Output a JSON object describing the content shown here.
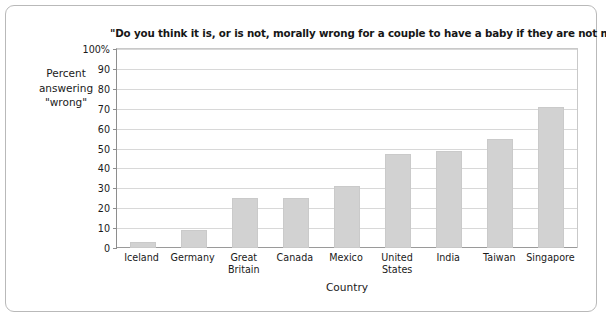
{
  "chart_data": {
    "type": "bar",
    "title": "\"Do you think it is, or is not, morally wrong for a couple to have a baby if they are not married?\"",
    "xlabel": "Country",
    "ylabel": "Percent answering \"wrong\"",
    "categories": [
      "Iceland",
      "Germany",
      "Great Britain",
      "Canada",
      "Mexico",
      "United States",
      "India",
      "Taiwan",
      "Singapore"
    ],
    "values": [
      3,
      9,
      25,
      25,
      31,
      47,
      49,
      55,
      71
    ],
    "ylim": [
      0,
      100
    ],
    "yticks": [
      0,
      10,
      20,
      30,
      40,
      50,
      60,
      70,
      80,
      90,
      100
    ],
    "ytick_labels": [
      "0",
      "10",
      "20",
      "30",
      "40",
      "50",
      "60",
      "70",
      "80",
      "90",
      "100%"
    ],
    "grid": true,
    "legend": false,
    "bar_color": "#d2d2d2",
    "grid_color": "#d8d8d8",
    "axis_color": "#8e8e8e"
  },
  "ylabel_lines": {
    "line1": "Percent",
    "line2": "answering",
    "line3": "\"wrong\""
  },
  "xlabel_lines": {
    "great_britain_1": "Great",
    "great_britain_2": "Britain",
    "united_states_1": "United",
    "united_states_2": "States"
  }
}
